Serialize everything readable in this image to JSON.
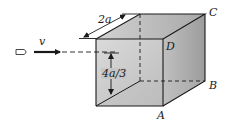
{
  "diagram": {
    "colors": {
      "line": "#1a1a1a",
      "face_front": "#c9c9c9",
      "face_top": "#b5b5b5",
      "face_right": "#a9a9a9"
    },
    "labels": {
      "velocity": "v",
      "depth_dimension": "2a",
      "height_dimension": "4a/3",
      "corner_a": "A",
      "corner_b": "B",
      "corner_c": "C",
      "corner_d": "D"
    }
  }
}
